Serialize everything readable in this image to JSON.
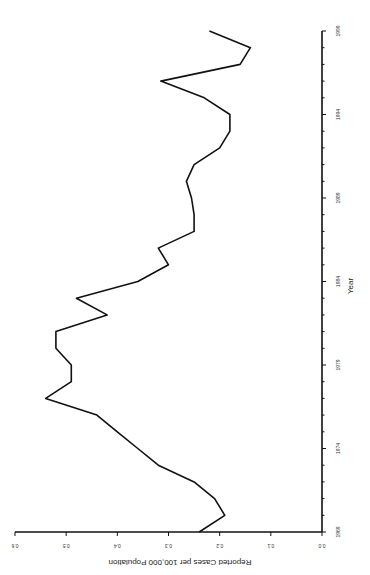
{
  "chart_data": {
    "type": "line",
    "title": "",
    "xlabel": "Year",
    "ylabel": "Reported Cases per 100,000 Population",
    "orientation": "rotated 90 degrees (x-axis vertical on right, years increasing upward; values increasing leftward)",
    "x_ticks": [
      "1969",
      "1974",
      "1979",
      "1984",
      "1989",
      "1994",
      "1999"
    ],
    "y_ticks": [
      "0.0",
      "0.1",
      "0.2",
      "0.3",
      "0.4",
      "0.5",
      "0.6"
    ],
    "xlim": [
      1969,
      1999
    ],
    "ylim": [
      0.0,
      0.6
    ],
    "grid": false,
    "legend": null,
    "series": [
      {
        "name": "Reported Cases per 100,000 Population",
        "x": [
          1969,
          1970,
          1971,
          1972,
          1973,
          1974,
          1975,
          1976,
          1977,
          1978,
          1979,
          1980,
          1981,
          1982,
          1983,
          1984,
          1985,
          1986,
          1987,
          1988,
          1989,
          1990,
          1991,
          1992,
          1993,
          1994,
          1995,
          1996,
          1997,
          1998,
          1999
        ],
        "values": [
          0.24,
          0.19,
          0.21,
          0.25,
          0.32,
          0.36,
          0.4,
          0.44,
          0.54,
          0.49,
          0.49,
          0.52,
          0.52,
          0.42,
          0.48,
          0.36,
          0.3,
          0.32,
          0.25,
          0.25,
          0.255,
          0.265,
          0.25,
          0.2,
          0.18,
          0.18,
          0.23,
          0.315,
          0.16,
          0.14,
          0.22
        ]
      }
    ]
  }
}
